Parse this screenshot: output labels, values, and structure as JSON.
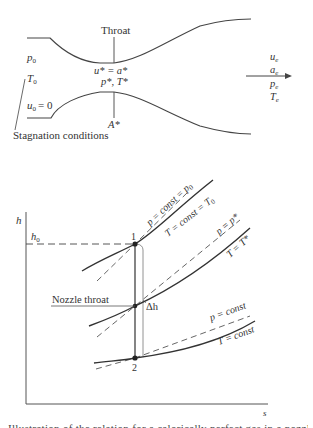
{
  "nozzle_diagram": {
    "throat_label": "Throat",
    "inlet": {
      "pressure": "p",
      "pressure_sub": "0",
      "temperature": "T",
      "temperature_sub": "0",
      "velocity": "u",
      "velocity_sub": "0",
      "velocity_value": "= 0"
    },
    "throat_conditions": {
      "line1": "u* = a*",
      "line2": "p*, T*",
      "area": "A*"
    },
    "exit": {
      "u": "u",
      "a": "a",
      "p": "p",
      "T": "T",
      "sub": "e"
    },
    "stagnation_label": "Stagnation conditions"
  },
  "hs_diagram": {
    "y_axis_label": "h",
    "x_axis_label": "s",
    "h0_label": "h",
    "h0_sub": "0",
    "point1_label": "1",
    "point2_label": "2",
    "nozzle_throat_label": "Nozzle throat",
    "delta_h_label": "Δh",
    "curves": {
      "p0": "p = const = p",
      "p0_sub": "0",
      "T0": "T = const = T",
      "T0_sub": "0",
      "pstar": "p = p*",
      "Tstar": "T = T*",
      "p_const": "p = const",
      "T_const": "T = const"
    }
  },
  "caption": "Illustration of the relation for a calorically perfect gas in a nozzle flow"
}
